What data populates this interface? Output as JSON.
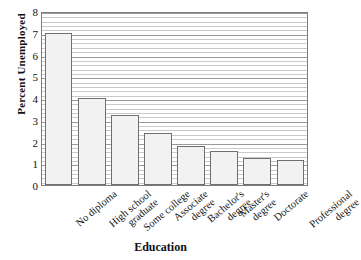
{
  "chart_data": {
    "type": "bar",
    "title": "",
    "xlabel": "Education",
    "ylabel": "Percent Unemployed",
    "ylim": [
      0,
      8
    ],
    "yticks": [
      0,
      1,
      2,
      3,
      4,
      5,
      6,
      7,
      8
    ],
    "grid": "horizontal-minor",
    "legend": "none",
    "categories": [
      "No diploma",
      "High school graduate",
      "Some college",
      "Associate degree",
      "Bachelor's degree",
      "Master's degree",
      "Doctorate",
      "Professional degree"
    ],
    "category_lines": [
      [
        "No diploma",
        ""
      ],
      [
        "High school",
        "graduate"
      ],
      [
        "Some college",
        ""
      ],
      [
        "Associate",
        "degree"
      ],
      [
        "Bachelor's",
        "degree"
      ],
      [
        "Master's",
        "degree"
      ],
      [
        "Doctorate",
        ""
      ],
      [
        "Professional",
        "degree"
      ]
    ],
    "values": [
      7.0,
      4.0,
      3.2,
      2.4,
      1.8,
      1.55,
      1.25,
      1.15
    ],
    "series": [
      {
        "name": "Percent Unemployed",
        "values": [
          7.0,
          4.0,
          3.2,
          2.4,
          1.8,
          1.55,
          1.25,
          1.15
        ]
      }
    ],
    "bar_fill": "#f2f2f2",
    "bar_border": "#6f6f6f",
    "frame_color": "#7d7d7d",
    "gridline_color": "#c9c9c9"
  }
}
